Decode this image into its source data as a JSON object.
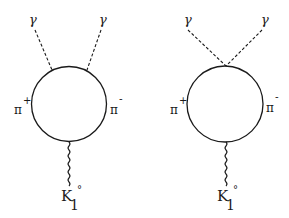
{
  "diagrams": [
    {
      "name": "separate-vertex",
      "photon_left": "γ",
      "photon_right": "γ",
      "pion_plus": {
        "symbol": "π",
        "charge": "+"
      },
      "pion_minus": {
        "symbol": "π",
        "charge": "-"
      },
      "kaon": {
        "symbol": "K",
        "subscript": "1",
        "superscript": "°"
      }
    },
    {
      "name": "contact-vertex",
      "photon_left": "γ",
      "photon_right": "γ",
      "pion_plus": {
        "symbol": "π",
        "charge": "+"
      },
      "pion_minus": {
        "symbol": "π",
        "charge": "-"
      },
      "kaon": {
        "symbol": "K",
        "subscript": "1",
        "superscript": "°"
      }
    }
  ],
  "style": {
    "line_color": "#1a1a1a",
    "background": "#ffffff"
  }
}
